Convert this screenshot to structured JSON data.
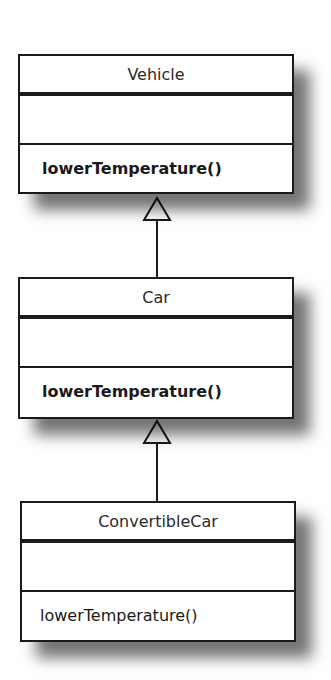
{
  "diagram": {
    "type": "UML class inheritance",
    "classes": [
      {
        "name": "Vehicle",
        "attributes": [],
        "methods": [
          "lowerTemperature()"
        ],
        "methods_bold": true
      },
      {
        "name": "Car",
        "attributes": [],
        "methods": [
          "lowerTemperature()"
        ],
        "methods_bold": true
      },
      {
        "name": "ConvertibleCar",
        "attributes": [],
        "methods": [
          "lowerTemperature()"
        ],
        "methods_bold": false
      }
    ],
    "relations": [
      {
        "from": "Car",
        "to": "Vehicle",
        "kind": "generalization"
      },
      {
        "from": "ConvertibleCar",
        "to": "Car",
        "kind": "generalization"
      }
    ]
  }
}
